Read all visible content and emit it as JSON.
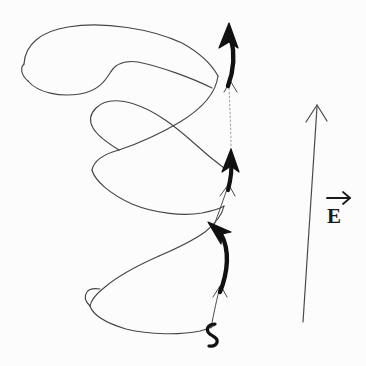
{
  "figure": {
    "kind": "hand-drawn-physics-sketch",
    "width": 366,
    "height": 366,
    "background_color": "#fcfcfc",
    "ink_color": "#3a3a3a",
    "bold_ink_color": "#111111"
  },
  "labels": {
    "field_vector": "E",
    "field_vector_accent": "vector-arrow-overbar"
  },
  "annotations": {
    "field_arrow": {
      "name": "electric-field-arrow",
      "direction": "up",
      "tip": [
        317,
        105
      ],
      "tail": [
        303,
        322
      ]
    },
    "motion_arrows": [
      {
        "name": "motion-arrow-top",
        "direction": "up",
        "tip": [
          228,
          26
        ]
      },
      {
        "name": "motion-arrow-middle",
        "direction": "up",
        "tip": [
          231,
          152
        ]
      },
      {
        "name": "motion-arrow-bottom",
        "direction": "up-left",
        "tip": [
          211,
          224
        ]
      }
    ],
    "connector_arrows": [
      {
        "name": "connector-arrow-upper",
        "direction": "up",
        "tip": [
          232,
          83
        ]
      },
      {
        "name": "connector-arrow-middle",
        "direction": "up",
        "tip": [
          228,
          185
        ]
      },
      {
        "name": "connector-arrow-lower",
        "direction": "up",
        "tip": [
          220,
          285
        ]
      }
    ],
    "tail_curl": {
      "name": "curve-tail-curl",
      "position": [
        211,
        331
      ]
    }
  },
  "strokes": {
    "top_lobe_outer": "M 22,62 C 24,40 46,29 74,26 C 110,22 160,31 186,44 C 202,52 210,62 215,74",
    "top_lobe_inner": "M 27,80 C 36,92 58,96 78,93 C 96,90 104,80 108,72 C 112,64 120,60 134,62 C 158,66 190,76 206,84",
    "top_lobe_left_cap": "M 22,62 C 19,67 20,74 27,80",
    "top_to_mid": "M 215,74 C 212,88 200,104 178,118 C 156,132 132,142 118,148",
    "mid_lobe_upper": "M 118,148 C 104,140 96,134 92,128 C 88,122 88,116 92,110 C 98,102 112,98 128,102 C 150,108 172,124 192,142 C 204,152 214,160 222,166",
    "mid_lobe_lower": "M 92,168 C 96,178 110,192 132,202 C 156,212 184,214 202,212 C 212,211 218,209 222,207",
    "mid_lobe_left_cap": "M 118,148 C 104,152 94,158 92,168",
    "mid_to_bottom": "M 222,207 C 220,214 214,222 204,230 C 190,240 172,248 158,254",
    "bottom_lobe_upper": "M 158,254 C 140,262 118,274 104,286 C 94,294 90,300 90,306",
    "bottom_lobe_lower": "M 90,306 C 92,314 104,322 124,328 C 148,334 180,334 200,330 C 208,328 212,326 214,324",
    "bottom_lobe_left_cap": "M 90,306 C 86,300 84,296 86,292"
  }
}
